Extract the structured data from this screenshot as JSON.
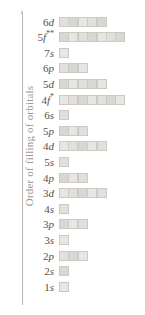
{
  "figure": {
    "axis_title": "Order of filling of orbitals",
    "axis_arrow_icon": "up-arrow-icon",
    "axis_color": "#b9b5b0",
    "box_fill_color": "#e2e0dd",
    "box_border_color": "#cdcac6",
    "label_color": "#55504b",
    "title_color": "#9b9791"
  },
  "chart_data": {
    "type": "bar",
    "title": "",
    "subtitle": "",
    "xlabel": "",
    "ylabel": "Order of filling of orbitals",
    "orientation": "horizontal",
    "grid": false,
    "legend": "none",
    "note": "Aufbau order of filling; bar length = number of orbitals (boxes) in each subshell",
    "categories": [
      "6d",
      "5f**",
      "7s",
      "6p",
      "5d",
      "4f*",
      "6s",
      "5p",
      "4d",
      "5s",
      "4p",
      "3d",
      "4s",
      "3p",
      "3s",
      "2p",
      "2s",
      "1s"
    ],
    "values": [
      5,
      7,
      1,
      3,
      5,
      7,
      1,
      3,
      5,
      1,
      3,
      5,
      1,
      3,
      1,
      3,
      1,
      1
    ],
    "ylim": [
      0,
      18
    ],
    "xlim": [
      0,
      7
    ]
  },
  "rows": [
    {
      "n": "6",
      "l": "d",
      "marks": "",
      "label_plain": "6d",
      "boxes": 5
    },
    {
      "n": "5",
      "l": "f",
      "marks": "**",
      "label_plain": "5f**",
      "boxes": 7
    },
    {
      "n": "7",
      "l": "s",
      "marks": "",
      "label_plain": "7s",
      "boxes": 1
    },
    {
      "n": "6",
      "l": "p",
      "marks": "",
      "label_plain": "6p",
      "boxes": 3
    },
    {
      "n": "5",
      "l": "d",
      "marks": "",
      "label_plain": "5d",
      "boxes": 5
    },
    {
      "n": "4",
      "l": "f",
      "marks": "*",
      "label_plain": "4f*",
      "boxes": 7
    },
    {
      "n": "6",
      "l": "s",
      "marks": "",
      "label_plain": "6s",
      "boxes": 1
    },
    {
      "n": "5",
      "l": "p",
      "marks": "",
      "label_plain": "5p",
      "boxes": 3
    },
    {
      "n": "4",
      "l": "d",
      "marks": "",
      "label_plain": "4d",
      "boxes": 5
    },
    {
      "n": "5",
      "l": "s",
      "marks": "",
      "label_plain": "5s",
      "boxes": 1
    },
    {
      "n": "4",
      "l": "p",
      "marks": "",
      "label_plain": "4p",
      "boxes": 3
    },
    {
      "n": "3",
      "l": "d",
      "marks": "",
      "label_plain": "3d",
      "boxes": 5
    },
    {
      "n": "4",
      "l": "s",
      "marks": "",
      "label_plain": "4s",
      "boxes": 1
    },
    {
      "n": "3",
      "l": "p",
      "marks": "",
      "label_plain": "3p",
      "boxes": 3
    },
    {
      "n": "3",
      "l": "s",
      "marks": "",
      "label_plain": "3s",
      "boxes": 1
    },
    {
      "n": "2",
      "l": "p",
      "marks": "",
      "label_plain": "2p",
      "boxes": 3
    },
    {
      "n": "2",
      "l": "s",
      "marks": "",
      "label_plain": "2s",
      "boxes": 1
    },
    {
      "n": "1",
      "l": "s",
      "marks": "",
      "label_plain": "1s",
      "boxes": 1
    }
  ]
}
